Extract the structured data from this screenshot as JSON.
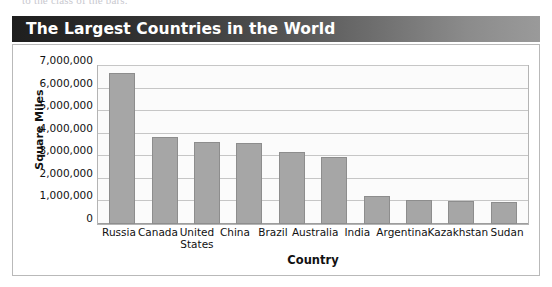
{
  "page": {
    "cutoff_text_above": "to the class of the bars."
  },
  "banner": {
    "title": "The Largest Countries in the World",
    "gradient_start": "#1e1e1e",
    "gradient_end": "#9a9a9a",
    "text_color": "#ffffff"
  },
  "chart_data": {
    "type": "bar",
    "title": "The Largest Countries in the World",
    "xlabel": "Country",
    "ylabel": "Square Miles",
    "categories": [
      "Russia",
      "Canada",
      "United States",
      "China",
      "Brazil",
      "Australia",
      "India",
      "Argentina",
      "Kazakhstan",
      "Sudan"
    ],
    "values": [
      6700000,
      3850000,
      3650000,
      3600000,
      3200000,
      2950000,
      1250000,
      1070000,
      1000000,
      970000
    ],
    "ylim": [
      0,
      7000000
    ],
    "ytick_values": [
      0,
      1000000,
      2000000,
      3000000,
      4000000,
      5000000,
      6000000,
      7000000
    ],
    "ytick_labels": [
      "0",
      "1,000,000",
      "2,000,000",
      "3,000,000",
      "4,000,000",
      "5,000,000",
      "6,000,000",
      "7,000,000"
    ],
    "grid": true,
    "legend": false,
    "bar_color": "#a6a6a6",
    "bar_border_color": "#8d8d8d",
    "plot_background": "#fbfbfb",
    "gridline_color": "#c6c6c6"
  }
}
